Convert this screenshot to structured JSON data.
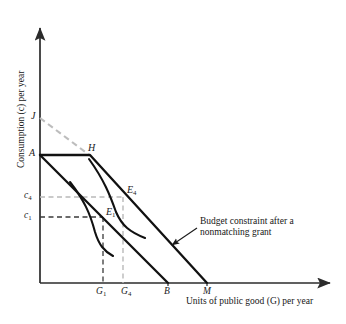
{
  "figure": {
    "kind": "economics-budget-constraint-diagram",
    "background_color": "#ffffff",
    "line_color": "#111111",
    "dash_color_light": "#b9b9b9",
    "dash_color_dark": "#3a3a3a",
    "axis_color": "#2b2b2b"
  },
  "axes": {
    "y_title": "Consumption (c) per year",
    "x_title": "Units of public good (G) per year",
    "origin": {
      "x": 40,
      "y": 283
    },
    "x_axis_end": {
      "x": 336,
      "y": 283
    },
    "y_axis_top": {
      "x": 40,
      "y": 22
    }
  },
  "y_ticks": [
    {
      "label": "c",
      "sub": "4",
      "y": 197
    },
    {
      "label": "c",
      "sub": "1",
      "y": 217
    }
  ],
  "x_ticks": [
    {
      "label": "G",
      "sub": "1",
      "x": 103
    },
    {
      "label": "G",
      "sub": "4",
      "x": 128
    },
    {
      "label": "B",
      "sub": "",
      "x": 168
    },
    {
      "label": "M",
      "sub": "",
      "x": 207
    }
  ],
  "points": [
    {
      "name": "J",
      "label": "J",
      "sub": "",
      "x": 40,
      "y": 118
    },
    {
      "name": "A",
      "label": "A",
      "sub": "",
      "x": 40,
      "y": 155
    },
    {
      "name": "H",
      "label": "H",
      "sub": "",
      "x": 90,
      "y": 155
    },
    {
      "name": "E4",
      "label": "E",
      "sub": "4",
      "x": 123,
      "y": 199
    },
    {
      "name": "E1",
      "label": "E",
      "sub": "1",
      "x": 103,
      "y": 217
    }
  ],
  "lines": {
    "original_budget_constraint": {
      "description": "Original budget constraint from A to B",
      "from": {
        "x": 40,
        "y": 155
      },
      "to": {
        "x": 168,
        "y": 283
      }
    },
    "nonmatching_grant_budget_constraint": {
      "description": "Budget constraint after a nonmatching grant: horizontal A to H then sloped H to M",
      "segment_flat": {
        "from": {
          "x": 40,
          "y": 155
        },
        "to": {
          "x": 90,
          "y": 155
        }
      },
      "segment_sloped": {
        "from": {
          "x": 90,
          "y": 155
        },
        "to": {
          "x": 207,
          "y": 283
        }
      }
    },
    "dashed_extension_J_to_H": {
      "description": "Light gray dashed line from J on the vertical axis to the kink point H",
      "from": {
        "x": 40,
        "y": 118
      },
      "to": {
        "x": 92,
        "y": 157
      }
    }
  },
  "indifference_curves": [
    {
      "name": "indifference-curve-E1",
      "tangent_point": {
        "x": 103,
        "y": 217
      },
      "path": "M 70,182 C 84,200 90,213 95,232 C 99,245 104,251 113,256"
    },
    {
      "name": "indifference-curve-E4",
      "tangent_point": {
        "x": 123,
        "y": 199
      },
      "path": "M 89,159 C 104,180 110,195 116,212 C 122,226 130,232 145,238"
    }
  ],
  "guides": [
    {
      "name": "guide-c4-horizontal",
      "style": "light-dashed",
      "from": {
        "x": 40,
        "y": 197
      },
      "to": {
        "x": 123,
        "y": 197
      }
    },
    {
      "name": "guide-G4-vertical",
      "style": "light-dashed",
      "from": {
        "x": 123,
        "y": 197
      },
      "to": {
        "x": 123,
        "y": 283
      }
    },
    {
      "name": "guide-c1-horizontal",
      "style": "dark-dashed",
      "from": {
        "x": 40,
        "y": 217
      },
      "to": {
        "x": 103,
        "y": 217
      }
    },
    {
      "name": "guide-G1-vertical",
      "style": "dark-dashed",
      "from": {
        "x": 103,
        "y": 217
      },
      "to": {
        "x": 103,
        "y": 283
      }
    }
  ],
  "annotation": {
    "name": "budget-constraint-callout",
    "line1": "Budget constraint after a",
    "line2": "nonmatching grant",
    "text_x": 200,
    "text_y": 223,
    "arrow_from": {
      "x": 197,
      "y": 228
    },
    "arrow_to": {
      "x": 172,
      "y": 245
    }
  }
}
